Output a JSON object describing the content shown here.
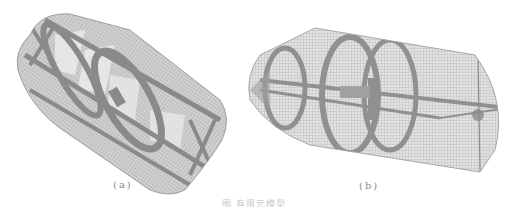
{
  "figure": {
    "panels": [
      {
        "id": "a",
        "label": "(a)",
        "description": "Wireframe finite-element mesh of capsule-shaped hull with ring frames and stringers, tilted view",
        "mesh_color": "#8c8c8c"
      },
      {
        "id": "b",
        "label": "(b)",
        "description": "Wireframe finite-element mesh of cylindrical hull with conical end, ring frames and internal keel beam",
        "mesh_color": "#8c8c8c"
      }
    ],
    "caption": "图 有限元模型"
  }
}
